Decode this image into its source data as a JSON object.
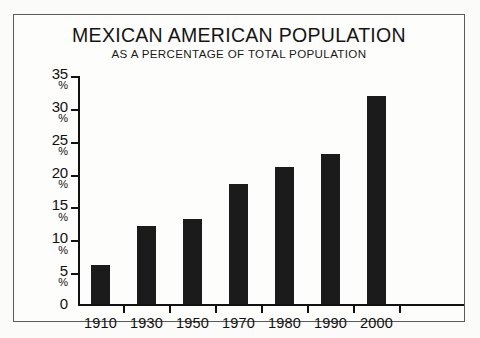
{
  "chart_data": {
    "type": "bar",
    "title": "MEXICAN AMERICAN POPULATION",
    "subtitle": "AS A PERCENTAGE OF TOTAL POPULATION",
    "xlabel": "",
    "ylabel": "",
    "categories": [
      "1910",
      "1930",
      "1950",
      "1970",
      "1980",
      "1990",
      "2000"
    ],
    "values": [
      6,
      12,
      13,
      18.5,
      21,
      23,
      32
    ],
    "ylim": [
      0,
      35
    ],
    "ytick_values": [
      35,
      30,
      25,
      20,
      15,
      10,
      5,
      0
    ],
    "ytick_labels": [
      {
        "num": "35",
        "pct": "%"
      },
      {
        "num": "30",
        "pct": "%"
      },
      {
        "num": "25",
        "pct": "%"
      },
      {
        "num": "20",
        "pct": "%"
      },
      {
        "num": "15",
        "pct": "%"
      },
      {
        "num": "10",
        "pct": "%"
      },
      {
        "num": "5",
        "pct": "%"
      },
      {
        "num": "0",
        "pct": ""
      }
    ],
    "grid": false,
    "legend": null,
    "bar_color": "#1b1b1b",
    "background_color": "#fdfdfb",
    "axis_color": "#111111",
    "border_color": "#5a5a5a"
  }
}
